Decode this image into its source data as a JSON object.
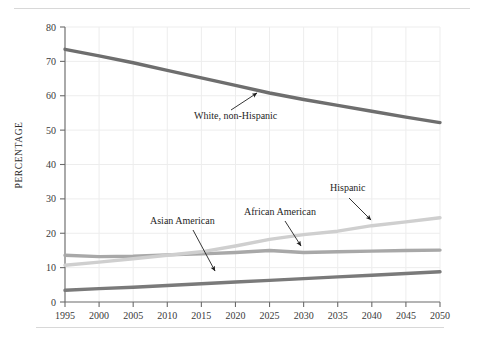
{
  "figure": {
    "y_axis_title": "PERCENTAGE"
  },
  "chart_data": {
    "type": "line",
    "title": "",
    "subtitle": "",
    "xlabel": "",
    "ylabel": "PERCENTAGE",
    "xlim": [
      1995,
      2050
    ],
    "ylim": [
      0,
      80
    ],
    "grid": true,
    "legend_position": "inline-annotations",
    "x_ticks": [
      1995,
      2000,
      2005,
      2010,
      2015,
      2020,
      2025,
      2030,
      2035,
      2040,
      2045,
      2050
    ],
    "y_ticks": [
      0,
      10,
      20,
      30,
      40,
      50,
      60,
      70,
      80
    ],
    "x": [
      1995,
      2000,
      2005,
      2010,
      2015,
      2020,
      2025,
      2030,
      2035,
      2040,
      2045,
      2050
    ],
    "series": [
      {
        "name": "White, non-Hispanic",
        "color": "#6e6e6e",
        "values": [
          73.5,
          71.6,
          69.6,
          67.4,
          65.2,
          63.0,
          60.8,
          58.9,
          57.2,
          55.5,
          53.8,
          52.2
        ]
      },
      {
        "name": "African American",
        "color": "#a8a8a8",
        "values": [
          13.6,
          13.2,
          13.3,
          13.7,
          14.0,
          14.4,
          15.0,
          14.4,
          14.6,
          14.8,
          15.0,
          15.1
        ]
      },
      {
        "name": "Hispanic",
        "color": "#cfcfcf",
        "values": [
          10.7,
          11.6,
          12.6,
          13.6,
          14.6,
          16.3,
          18.2,
          19.6,
          20.6,
          22.2,
          23.3,
          24.5
        ]
      },
      {
        "name": "Asian American",
        "color": "#7a7a7a",
        "values": [
          3.4,
          3.9,
          4.3,
          4.8,
          5.3,
          5.8,
          6.3,
          6.8,
          7.3,
          7.8,
          8.3,
          8.8
        ]
      }
    ],
    "annotations": [
      {
        "label": "White, non-Hispanic",
        "text_x": 194,
        "text_y": 119,
        "arrow_from_x": 231,
        "arrow_from_y": 110,
        "arrow_to_x": 257,
        "arrow_to_y": 93
      },
      {
        "label": "Asian American",
        "text_x": 150,
        "text_y": 224,
        "arrow_from_x": 193,
        "arrow_from_y": 230,
        "arrow_to_x": 215,
        "arrow_to_y": 271
      },
      {
        "label": "African American",
        "text_x": 244,
        "text_y": 215,
        "arrow_from_x": 285,
        "arrow_from_y": 221,
        "arrow_to_x": 301,
        "arrow_to_y": 246
      },
      {
        "label": "Hispanic",
        "text_x": 330,
        "text_y": 191,
        "arrow_from_x": 349,
        "arrow_from_y": 198,
        "arrow_to_x": 371,
        "arrow_to_y": 220
      }
    ]
  }
}
